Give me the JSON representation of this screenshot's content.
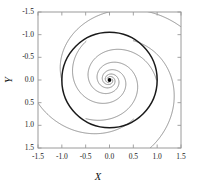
{
  "figure": {
    "kind": "phase-portrait",
    "background": "#ffffff",
    "frame_color": "#9a9a9a",
    "curve_color": "#6e6e6e",
    "cycle_color": "#1a1a1a",
    "point_color": "#000000"
  },
  "axes": {
    "x_label": "X",
    "y_label": "Y",
    "x_ticks": [
      "-1.5",
      "-1.0",
      "-0.5",
      "0.0",
      "0.5",
      "1.0",
      "1.5"
    ],
    "y_ticks": [
      "1.5",
      "1.0",
      "0.5",
      "0.0",
      "-0.5",
      "-1.0",
      "-1.5"
    ]
  },
  "chart_data": {
    "type": "line",
    "title": "",
    "xlabel": "X",
    "ylabel": "Y",
    "xlim": [
      -1.5,
      1.5
    ],
    "ylim": [
      -1.5,
      1.5
    ],
    "xticks": [
      -1.5,
      -1.0,
      -0.5,
      0.0,
      0.5,
      1.0,
      1.5
    ],
    "yticks": [
      -1.5,
      -1.0,
      -0.5,
      0.0,
      0.5,
      1.0,
      1.5
    ],
    "grid": false,
    "legend": "none",
    "annotations": [
      {
        "type": "point",
        "x": 0.0,
        "y": 0.0,
        "label": "equilibrium / focus"
      }
    ],
    "series": [
      {
        "name": "limit-cycle",
        "kind": "circle",
        "center": [
          0.0,
          0.0
        ],
        "radius": 1.0,
        "linewidth": 1.5,
        "color": "#1a1a1a"
      },
      {
        "name": "inner-spiral-1",
        "kind": "log-spiral",
        "r0": 0.985,
        "theta0_deg": 0,
        "growth": -0.26,
        "theta_span_deg": 620,
        "direction": "inward",
        "color": "#6e6e6e"
      },
      {
        "name": "inner-spiral-2",
        "kind": "log-spiral",
        "r0": 0.985,
        "theta0_deg": 120,
        "growth": -0.26,
        "theta_span_deg": 620,
        "direction": "inward",
        "color": "#6e6e6e"
      },
      {
        "name": "inner-spiral-3",
        "kind": "log-spiral",
        "r0": 0.985,
        "theta0_deg": 240,
        "growth": -0.26,
        "theta_span_deg": 620,
        "direction": "inward",
        "color": "#6e6e6e"
      },
      {
        "name": "outer-spiral-1",
        "kind": "log-spiral",
        "r0": 1.0,
        "theta0_deg": 60,
        "growth": 0.26,
        "theta_span_deg": 300,
        "direction": "outward",
        "color": "#6e6e6e"
      },
      {
        "name": "outer-spiral-2",
        "kind": "log-spiral",
        "r0": 1.0,
        "theta0_deg": 180,
        "growth": 0.26,
        "theta_span_deg": 300,
        "direction": "outward",
        "color": "#6e6e6e"
      },
      {
        "name": "outer-spiral-3",
        "kind": "log-spiral",
        "r0": 1.0,
        "theta0_deg": 300,
        "growth": 0.26,
        "theta_span_deg": 300,
        "direction": "outward",
        "color": "#6e6e6e"
      }
    ]
  }
}
